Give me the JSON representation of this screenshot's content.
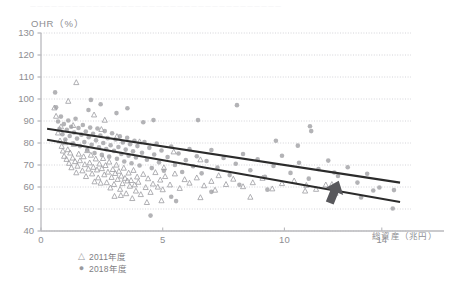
{
  "figure": {
    "top_cutoff_text": "一一一一一一一一一一一一一一一一一一一一一一一一一一一一一一一一一一一一",
    "y_axis_title": "OHR（%）",
    "x_axis_title": "総資産（兆円）"
  },
  "legend": {
    "items": [
      {
        "marker": "△",
        "label": "2011年度",
        "shape": "triangle"
      },
      {
        "marker": "●",
        "label": "2018年度",
        "shape": "circle"
      }
    ]
  },
  "colors": {
    "marker_gray": "#9d9da2",
    "trend_line": "#2b2b2b",
    "arrow": "#58585c",
    "axis": "#b9b9bd",
    "grid": "#c9c9cf",
    "text": "#8e8e92",
    "background": "#ffffff"
  },
  "chart_data": {
    "type": "scatter",
    "title": "",
    "xlabel": "総資産（兆円）",
    "ylabel": "OHR（%）",
    "xlim": [
      0,
      15.2
    ],
    "ylim": [
      40,
      130
    ],
    "xticks": [
      0,
      5,
      10,
      14
    ],
    "xticklabels": [
      "0",
      "5",
      "10",
      "14"
    ],
    "yticks": [
      40,
      50,
      60,
      70,
      80,
      90,
      100,
      110,
      120,
      130
    ],
    "yticklabels": [
      "40",
      "50",
      "60",
      "70",
      "80",
      "90",
      "100",
      "110",
      "120",
      "130"
    ],
    "grid": "horizontal-dotted",
    "legend_position": "below-axes-left",
    "series": [
      {
        "name": "2011年度",
        "marker": "triangle-open",
        "color": "#9d9da2",
        "points": [
          [
            0.55,
            96.0
          ],
          [
            0.62,
            92.2
          ],
          [
            0.7,
            84.6
          ],
          [
            0.78,
            81.0
          ],
          [
            0.85,
            78.5
          ],
          [
            0.9,
            76.4
          ],
          [
            0.95,
            74.0
          ],
          [
            1.0,
            80.2
          ],
          [
            1.05,
            72.6
          ],
          [
            1.1,
            77.0
          ],
          [
            1.15,
            70.8
          ],
          [
            1.2,
            75.5
          ],
          [
            1.25,
            68.8
          ],
          [
            1.3,
            73.2
          ],
          [
            1.35,
            79.4
          ],
          [
            1.4,
            71.6
          ],
          [
            1.45,
            66.5
          ],
          [
            1.5,
            69.5
          ],
          [
            1.55,
            75.0
          ],
          [
            1.6,
            72.0
          ],
          [
            1.12,
            99.0
          ],
          [
            1.45,
            107.5
          ],
          [
            1.7,
            67.4
          ],
          [
            1.75,
            73.8
          ],
          [
            1.8,
            70.2
          ],
          [
            1.85,
            64.8
          ],
          [
            1.9,
            76.6
          ],
          [
            1.95,
            68.2
          ],
          [
            2.0,
            71.0
          ],
          [
            2.05,
            74.5
          ],
          [
            2.1,
            66.0
          ],
          [
            2.15,
            69.0
          ],
          [
            2.2,
            62.4
          ],
          [
            2.25,
            72.8
          ],
          [
            2.3,
            67.8
          ],
          [
            2.35,
            64.2
          ],
          [
            2.4,
            70.5
          ],
          [
            2.45,
            61.8
          ],
          [
            2.5,
            68.4
          ],
          [
            2.55,
            73.0
          ],
          [
            2.6,
            65.6
          ],
          [
            2.65,
            69.8
          ],
          [
            2.7,
            62.0
          ],
          [
            2.75,
            66.8
          ],
          [
            2.8,
            71.4
          ],
          [
            2.85,
            59.6
          ],
          [
            2.9,
            64.4
          ],
          [
            2.95,
            68.0
          ],
          [
            3.0,
            61.2
          ],
          [
            3.05,
            66.2
          ],
          [
            2.18,
            92.8
          ],
          [
            2.62,
            90.4
          ],
          [
            3.1,
            70.0
          ],
          [
            3.15,
            63.5
          ],
          [
            3.2,
            67.2
          ],
          [
            3.25,
            59.0
          ],
          [
            3.3,
            65.0
          ],
          [
            3.35,
            61.6
          ],
          [
            3.4,
            68.6
          ],
          [
            3.45,
            64.0
          ],
          [
            3.5,
            57.0
          ],
          [
            3.55,
            62.8
          ],
          [
            3.6,
            66.4
          ],
          [
            3.65,
            60.4
          ],
          [
            3.7,
            63.0
          ],
          [
            3.75,
            54.8
          ],
          [
            3.8,
            67.6
          ],
          [
            3.85,
            61.0
          ],
          [
            3.9,
            58.2
          ],
          [
            3.95,
            64.6
          ],
          [
            4.0,
            62.2
          ],
          [
            4.1,
            56.6
          ],
          [
            4.2,
            65.8
          ],
          [
            4.3,
            59.8
          ],
          [
            4.4,
            63.8
          ],
          [
            4.5,
            57.6
          ],
          [
            4.6,
            61.4
          ],
          [
            4.7,
            66.6
          ],
          [
            4.8,
            60.0
          ],
          [
            4.9,
            63.2
          ],
          [
            5.0,
            58.8
          ],
          [
            5.1,
            64.8
          ],
          [
            5.3,
            61.0
          ],
          [
            5.5,
            66.0
          ],
          [
            5.7,
            59.4
          ],
          [
            5.9,
            63.4
          ],
          [
            6.1,
            61.8
          ],
          [
            6.4,
            64.2
          ],
          [
            6.7,
            60.6
          ],
          [
            7.0,
            62.6
          ],
          [
            7.3,
            65.2
          ],
          [
            7.6,
            61.2
          ],
          [
            7.9,
            63.6
          ],
          [
            8.3,
            60.2
          ],
          [
            8.7,
            62.0
          ],
          [
            9.1,
            64.0
          ],
          [
            9.5,
            59.2
          ],
          [
            9.9,
            61.6
          ],
          [
            10.4,
            62.8
          ],
          [
            10.9,
            60.8
          ],
          [
            11.3,
            59.0
          ],
          [
            11.7,
            61.0
          ],
          [
            12.1,
            57.2
          ],
          [
            2.48,
            86.2
          ],
          [
            3.12,
            83.0
          ],
          [
            4.05,
            80.6
          ],
          [
            5.45,
            76.0
          ],
          [
            6.55,
            72.4
          ],
          [
            1.32,
            88.0
          ],
          [
            0.82,
            87.4
          ],
          [
            4.35,
            53.0
          ],
          [
            4.95,
            53.8
          ],
          [
            6.55,
            55.2
          ],
          [
            8.6,
            55.4
          ],
          [
            10.85,
            58.2
          ],
          [
            11.95,
            61.2
          ],
          [
            5.05,
            68.8
          ],
          [
            7.15,
            58.6
          ],
          [
            3.02,
            55.8
          ],
          [
            3.28,
            56.2
          ]
        ]
      },
      {
        "name": "2018年度",
        "marker": "circle-filled",
        "color": "#9d9da2",
        "points": [
          [
            0.58,
            103.0
          ],
          [
            0.62,
            96.2
          ],
          [
            0.7,
            89.8
          ],
          [
            0.76,
            86.4
          ],
          [
            0.82,
            92.0
          ],
          [
            0.88,
            84.0
          ],
          [
            0.94,
            88.6
          ],
          [
            1.0,
            81.6
          ],
          [
            1.06,
            86.0
          ],
          [
            1.12,
            90.2
          ],
          [
            1.18,
            83.2
          ],
          [
            1.24,
            87.4
          ],
          [
            1.3,
            79.8
          ],
          [
            1.36,
            84.8
          ],
          [
            1.42,
            91.0
          ],
          [
            1.48,
            82.0
          ],
          [
            1.54,
            86.8
          ],
          [
            1.6,
            78.6
          ],
          [
            1.66,
            83.8
          ],
          [
            1.72,
            88.2
          ],
          [
            1.78,
            80.4
          ],
          [
            1.84,
            85.2
          ],
          [
            1.9,
            76.8
          ],
          [
            1.96,
            82.6
          ],
          [
            2.02,
            87.0
          ],
          [
            2.08,
            79.2
          ],
          [
            2.14,
            84.2
          ],
          [
            2.2,
            75.4
          ],
          [
            2.26,
            81.2
          ],
          [
            2.32,
            86.6
          ],
          [
            2.38,
            78.0
          ],
          [
            2.44,
            83.4
          ],
          [
            2.5,
            74.6
          ],
          [
            2.56,
            80.0
          ],
          [
            2.62,
            85.4
          ],
          [
            2.68,
            77.2
          ],
          [
            2.74,
            82.2
          ],
          [
            2.8,
            73.8
          ],
          [
            2.86,
            79.0
          ],
          [
            2.92,
            84.4
          ],
          [
            2.45,
            97.6
          ],
          [
            3.0,
            76.4
          ],
          [
            3.06,
            81.6
          ],
          [
            3.12,
            72.8
          ],
          [
            3.18,
            78.2
          ],
          [
            3.24,
            83.0
          ],
          [
            3.3,
            75.0
          ],
          [
            3.36,
            80.2
          ],
          [
            3.42,
            71.6
          ],
          [
            3.48,
            77.0
          ],
          [
            3.54,
            82.4
          ],
          [
            3.6,
            74.2
          ],
          [
            3.66,
            79.4
          ],
          [
            3.72,
            70.8
          ],
          [
            3.78,
            76.2
          ],
          [
            3.84,
            81.0
          ],
          [
            3.9,
            73.4
          ],
          [
            3.96,
            78.6
          ],
          [
            4.05,
            69.8
          ],
          [
            4.15,
            75.6
          ],
          [
            3.1,
            93.6
          ],
          [
            3.55,
            95.8
          ],
          [
            4.25,
            80.4
          ],
          [
            4.35,
            72.4
          ],
          [
            4.45,
            77.8
          ],
          [
            4.55,
            68.6
          ],
          [
            4.65,
            74.8
          ],
          [
            4.75,
            79.8
          ],
          [
            4.85,
            71.2
          ],
          [
            4.95,
            76.6
          ],
          [
            4.5,
            47.0
          ],
          [
            5.05,
            67.4
          ],
          [
            5.2,
            73.6
          ],
          [
            5.35,
            78.4
          ],
          [
            5.5,
            70.0
          ],
          [
            5.65,
            75.2
          ],
          [
            5.8,
            66.8
          ],
          [
            5.95,
            72.2
          ],
          [
            6.1,
            77.2
          ],
          [
            6.25,
            69.4
          ],
          [
            4.2,
            89.4
          ],
          [
            4.62,
            90.4
          ],
          [
            6.4,
            74.0
          ],
          [
            6.6,
            66.2
          ],
          [
            6.8,
            71.8
          ],
          [
            7.0,
            76.8
          ],
          [
            7.25,
            68.8
          ],
          [
            7.5,
            73.2
          ],
          [
            7.75,
            65.4
          ],
          [
            8.0,
            70.6
          ],
          [
            8.3,
            75.0
          ],
          [
            8.6,
            67.6
          ],
          [
            8.9,
            72.6
          ],
          [
            9.2,
            64.6
          ],
          [
            9.55,
            69.6
          ],
          [
            9.9,
            74.2
          ],
          [
            10.25,
            66.4
          ],
          [
            10.6,
            71.0
          ],
          [
            11.0,
            63.8
          ],
          [
            11.4,
            68.2
          ],
          [
            11.8,
            72.0
          ],
          [
            12.2,
            65.0
          ],
          [
            12.6,
            69.0
          ],
          [
            13.0,
            62.0
          ],
          [
            13.4,
            66.0
          ],
          [
            13.9,
            59.8
          ],
          [
            14.5,
            58.6
          ],
          [
            5.55,
            53.6
          ],
          [
            5.35,
            55.6
          ],
          [
            7.0,
            57.8
          ],
          [
            12.15,
            60.0
          ],
          [
            13.15,
            55.2
          ],
          [
            14.45,
            50.2
          ],
          [
            9.65,
            81.0
          ],
          [
            10.55,
            78.8
          ],
          [
            11.05,
            87.6
          ],
          [
            11.1,
            85.4
          ],
          [
            8.05,
            97.2
          ],
          [
            6.45,
            90.4
          ],
          [
            2.05,
            99.6
          ],
          [
            1.95,
            95.0
          ],
          [
            13.65,
            58.4
          ],
          [
            12.05,
            66.6
          ],
          [
            9.3,
            58.8
          ],
          [
            8.15,
            61.0
          ]
        ]
      }
    ],
    "trend_lines": [
      {
        "name": "2018年度 trend",
        "color": "#2b2b2b",
        "x_start": 0.25,
        "y_start": 86.5,
        "x_end": 14.75,
        "y_end": 62.0
      },
      {
        "name": "2011年度 trend",
        "color": "#2b2b2b",
        "x_start": 0.25,
        "y_start": 81.5,
        "x_end": 14.75,
        "y_end": 53.2
      }
    ],
    "annotations": [
      {
        "type": "arrow",
        "name": "upward-arrow",
        "color": "#58585c",
        "x": 12.0,
        "y": 56.5,
        "direction": "up-right",
        "label": ""
      }
    ]
  }
}
